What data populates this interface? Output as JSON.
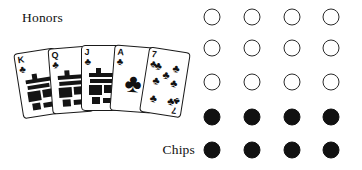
{
  "figure": {
    "width": 362,
    "height": 170,
    "background": "#ffffff",
    "ink_color": "#111111"
  },
  "labels": {
    "honors": "Honors",
    "chips": "Chips"
  },
  "hand": {
    "name": "card-fan",
    "suit_symbol": "♣",
    "suit_name": "clubs",
    "count": 5,
    "cards": [
      {
        "rank": "K",
        "suit": "♣",
        "suit_name": "clubs",
        "name": "king-of-clubs",
        "type": "court",
        "left": 22,
        "top": 50,
        "rotate": -9
      },
      {
        "rank": "Q",
        "suit": "♣",
        "suit_name": "clubs",
        "name": "queen-of-clubs",
        "type": "court",
        "left": 52,
        "top": 47,
        "rotate": -4.5
      },
      {
        "rank": "J",
        "suit": "♣",
        "suit_name": "clubs",
        "name": "jack-of-clubs",
        "type": "court",
        "left": 81,
        "top": 45,
        "rotate": 0
      },
      {
        "rank": "A",
        "suit": "♣",
        "suit_name": "clubs",
        "name": "ace-of-clubs",
        "type": "ace",
        "left": 110,
        "top": 46,
        "rotate": 4.5
      },
      {
        "rank": "7",
        "suit": "♣",
        "suit_name": "clubs",
        "name": "seven-of-clubs",
        "type": "pip",
        "left": 140,
        "top": 49,
        "rotate": 9
      }
    ]
  },
  "chips": {
    "name": "chip-grid",
    "rows": 5,
    "columns": 4,
    "open_rows": 3,
    "filled_rows": 2,
    "total": 20,
    "open_count": 12,
    "filled_count": 8,
    "open_color": "#2b2b2b",
    "filled_color": "#111111",
    "diameter": 17,
    "column_x": [
      212,
      252,
      292,
      331
    ],
    "row_y": [
      17,
      48,
      82,
      117,
      150
    ],
    "grid": [
      [
        "open",
        "open",
        "open",
        "open"
      ],
      [
        "open",
        "open",
        "open",
        "open"
      ],
      [
        "open",
        "open",
        "open",
        "open"
      ],
      [
        "filled",
        "filled",
        "filled",
        "filled"
      ],
      [
        "filled",
        "filled",
        "filled",
        "filled"
      ]
    ]
  }
}
